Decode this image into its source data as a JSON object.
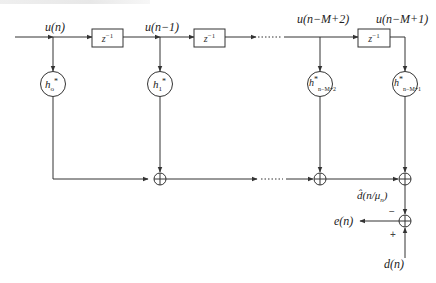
{
  "diagram": {
    "type": "transversal-filter-block-diagram",
    "inputs": {
      "u0": "u(n)",
      "u1": "u(n−1)",
      "uM2": "u(n−M+2)",
      "uM1": "u(n−M+1)"
    },
    "delay_label": {
      "base": "z",
      "exp": "−1"
    },
    "coefficients": [
      {
        "base": "h",
        "star": "*",
        "sub": "o"
      },
      {
        "base": "h",
        "star": "*",
        "sub": "1"
      },
      {
        "base": "h",
        "star": "*",
        "sub": "n−M+2"
      },
      {
        "base": "h",
        "star": "*",
        "sub": "n−M+1"
      }
    ],
    "ellipsis": "······",
    "estimate": {
      "prefix": "d̂(n/μ",
      "sub": "n",
      "suffix": ")"
    },
    "error_label": "e(n)",
    "desired_label": "d(n)",
    "signs": {
      "minus": "−",
      "plus": "+"
    },
    "colors": {
      "line": "#333333",
      "background": "#ffffff"
    }
  }
}
